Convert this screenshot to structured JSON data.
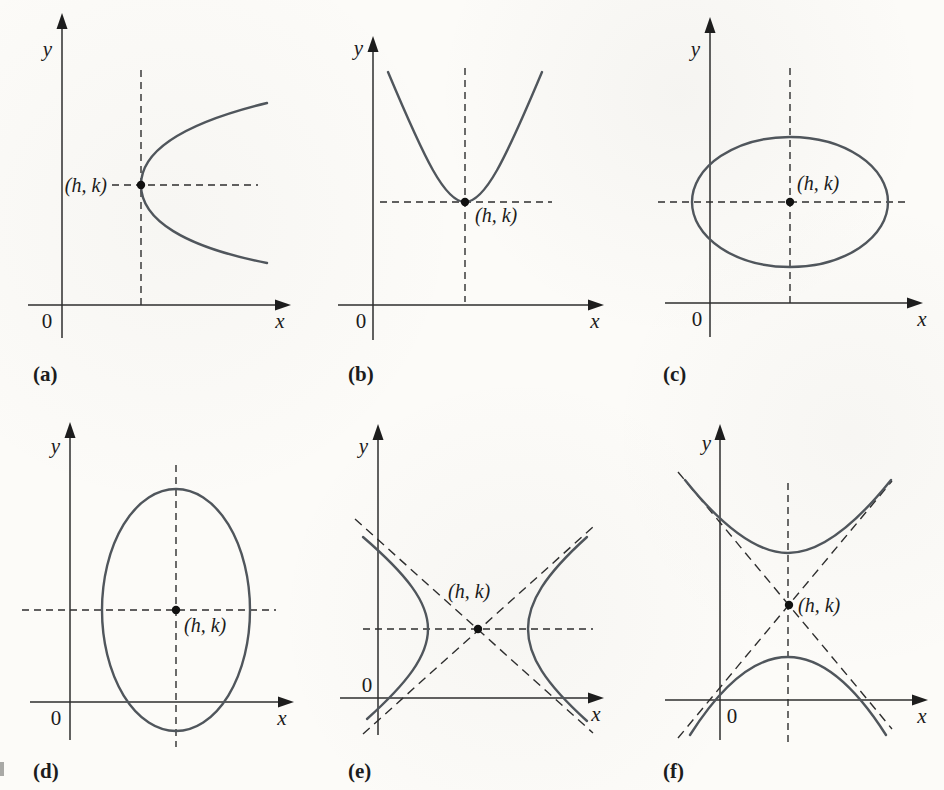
{
  "figure_title": "Conic sections translated to center/vertex (h, k)",
  "colors": {
    "background": "#fcfbf8",
    "curve": "#50565c",
    "axis_and_dashes": "#2e2e2e",
    "point_dot": "#111111",
    "text": "#1c1c1c"
  },
  "labels": {
    "x_axis": "x",
    "y_axis": "y",
    "origin": "0",
    "point": "(h, k)"
  },
  "panels": [
    {
      "letter": "(a)",
      "shape": "parabola opening right, vertex at (h, k), dashed vertical axis line and dashed horizontal axis of symmetry through vertex"
    },
    {
      "letter": "(b)",
      "shape": "parabola opening upward, vertex at (h, k), dashed vertical axis of symmetry and dashed horizontal line through vertex"
    },
    {
      "letter": "(c)",
      "shape": "ellipse with horizontal major axis, center (h, k), dashed major and minor axis lines"
    },
    {
      "letter": "(d)",
      "shape": "ellipse with vertical major axis, center (h, k), dashed major and minor axis lines"
    },
    {
      "letter": "(e)",
      "shape": "hyperbola opening left and right, center (h, k), dashed asymptotes and dashed horizontal transverse axis"
    },
    {
      "letter": "(f)",
      "shape": "hyperbola opening up and down, center (h, k), dashed asymptotes and dashed vertical transverse axis"
    }
  ]
}
